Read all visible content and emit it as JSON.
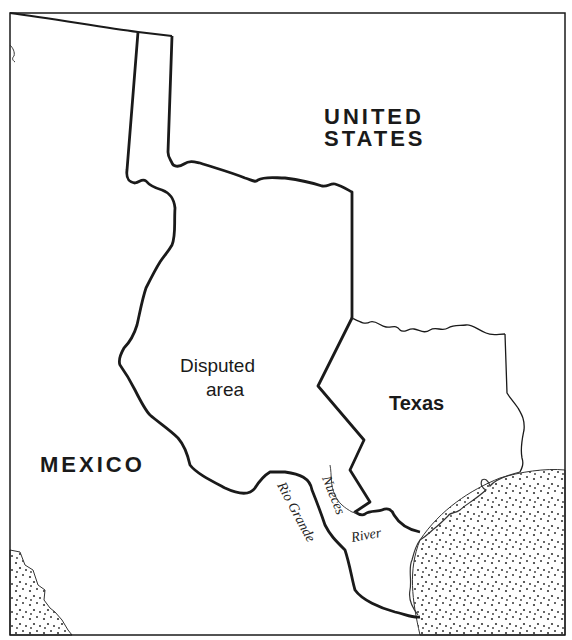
{
  "map": {
    "labels": {
      "united_states_line1": "UNITED",
      "united_states_line2": "STATES",
      "mexico": "MEXICO",
      "disputed_line1": "Disputed",
      "disputed_line2": "area",
      "texas": "Texas",
      "rio_grande": "Rio Grande",
      "nueces": "Nueces",
      "river": "River"
    },
    "colors": {
      "background": "#ffffff",
      "border": "#1a1a1a",
      "water_dots": "#333333"
    },
    "regions": [
      "United States",
      "Mexico",
      "Disputed area",
      "Texas",
      "Gulf of Mexico (dotted)",
      "Pacific Ocean (dotted)"
    ],
    "rivers": [
      "Rio Grande",
      "Nueces River"
    ]
  }
}
